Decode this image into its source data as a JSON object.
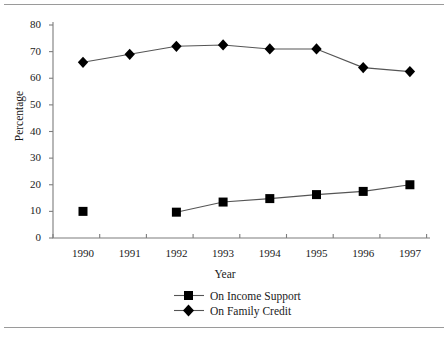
{
  "chart_data": {
    "type": "line",
    "title": "",
    "xlabel": "Year",
    "ylabel": "Percentage",
    "categories": [
      "1990",
      "1991",
      "1992",
      "1993",
      "1994",
      "1995",
      "1996",
      "1997"
    ],
    "ylim": [
      0,
      80
    ],
    "yticks": [
      "0",
      "10",
      "20",
      "30",
      "40",
      "50",
      "60",
      "70",
      "80"
    ],
    "grid": false,
    "legend_position": "bottom",
    "series": [
      {
        "name": "On Income Support",
        "marker": "square",
        "color": "#000000",
        "values": [
          10,
          null,
          9.7,
          13.5,
          14.8,
          16.3,
          17.5,
          20
        ]
      },
      {
        "name": "On Family Credit",
        "marker": "diamond",
        "color": "#000000",
        "values": [
          66,
          69,
          72,
          72.5,
          71,
          71,
          64,
          62.5
        ]
      }
    ]
  },
  "legend": {
    "items": [
      {
        "label": "On Income Support",
        "marker": "square"
      },
      {
        "label": "On Family Credit",
        "marker": "diamond"
      }
    ]
  },
  "axes": {
    "y_title": "Percentage",
    "x_title": "Year"
  },
  "colors": {
    "axis": "#7d7d7d",
    "line": "#555555",
    "marker": "#000000",
    "rule": "#9a9a9a",
    "text": "#1a1a1a"
  }
}
